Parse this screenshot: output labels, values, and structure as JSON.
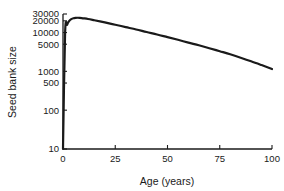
{
  "chart_data": {
    "type": "line",
    "title": "",
    "xlabel": "Age (years)",
    "ylabel": "Seed bank size",
    "xlim": [
      0,
      100
    ],
    "ylim": [
      10,
      30000
    ],
    "yscale": "log",
    "xscale": "linear",
    "grid": false,
    "legend": null,
    "xticks": [
      0,
      25,
      50,
      75,
      100
    ],
    "xtick_labels": [
      "0",
      "25",
      "50",
      "75",
      "100"
    ],
    "yticks": [
      10,
      100,
      500,
      1000,
      5000,
      10000,
      20000,
      30000
    ],
    "ytick_labels": [
      "10",
      "100",
      "500",
      "1000",
      "5000",
      "10000",
      "20000",
      "30000"
    ],
    "series": [
      {
        "name": "Seed bank size",
        "color": "#1a1a1a",
        "x": [
          0,
          1,
          2,
          3,
          4,
          5,
          6,
          7,
          8,
          9,
          10,
          12,
          15,
          20,
          25,
          30,
          35,
          40,
          45,
          50,
          55,
          60,
          65,
          70,
          75,
          80,
          85,
          90,
          95,
          100
        ],
        "y": [
          10,
          9500,
          16000,
          20000,
          22200,
          23400,
          23900,
          24000,
          23900,
          23600,
          23200,
          22300,
          20700,
          18200,
          15900,
          13800,
          12000,
          10300,
          8900,
          7600,
          6500,
          5500,
          4700,
          3950,
          3300,
          2750,
          2250,
          1820,
          1450,
          1150
        ]
      }
    ],
    "annotations": []
  },
  "axis": {
    "x_title": "Age (years)",
    "y_title": "Seed bank size"
  }
}
